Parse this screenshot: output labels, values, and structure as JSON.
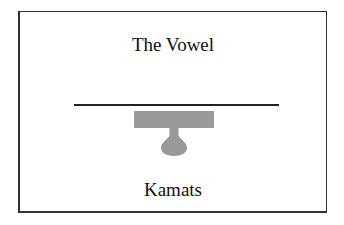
{
  "card": {
    "title": "The Vowel",
    "label": "Kamats"
  },
  "diagram": {
    "baseline_color": "#222222",
    "mark_color": "#999999",
    "mark_shape": "kamats-vowel-mark"
  }
}
